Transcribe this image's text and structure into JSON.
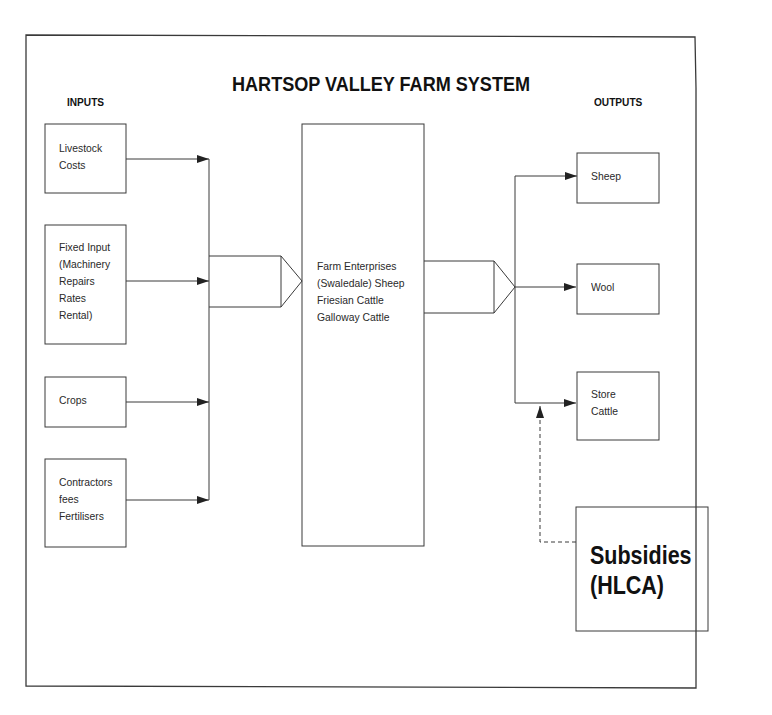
{
  "title": "HARTSOP VALLEY FARM SYSTEM",
  "inputs": {
    "heading": "INPUTS",
    "items": [
      {
        "lines": [
          "Livestock",
          "Costs"
        ]
      },
      {
        "lines": [
          "Fixed Input",
          "(Machinery",
          "Repairs",
          "Rates",
          "Rental)"
        ]
      },
      {
        "lines": [
          "Crops"
        ]
      },
      {
        "lines": [
          "Contractors",
          "fees",
          "Fertilisers"
        ]
      }
    ]
  },
  "process": {
    "lines": [
      "Farm Enterprises",
      "(Swaledale) Sheep",
      "Friesian Cattle",
      "Galloway Cattle"
    ]
  },
  "outputs": {
    "heading": "OUTPUTS",
    "items": [
      {
        "lines": [
          "Sheep"
        ]
      },
      {
        "lines": [
          "Wool"
        ]
      },
      {
        "lines": [
          "Store",
          "Cattle"
        ]
      }
    ]
  },
  "subsidies": {
    "lines": [
      "Subsidies",
      "(HLCA)"
    ],
    "connector": "dashed"
  },
  "colors": {
    "line": "#3a3a3a",
    "text": "#1a1a1a",
    "background": "#ffffff"
  }
}
